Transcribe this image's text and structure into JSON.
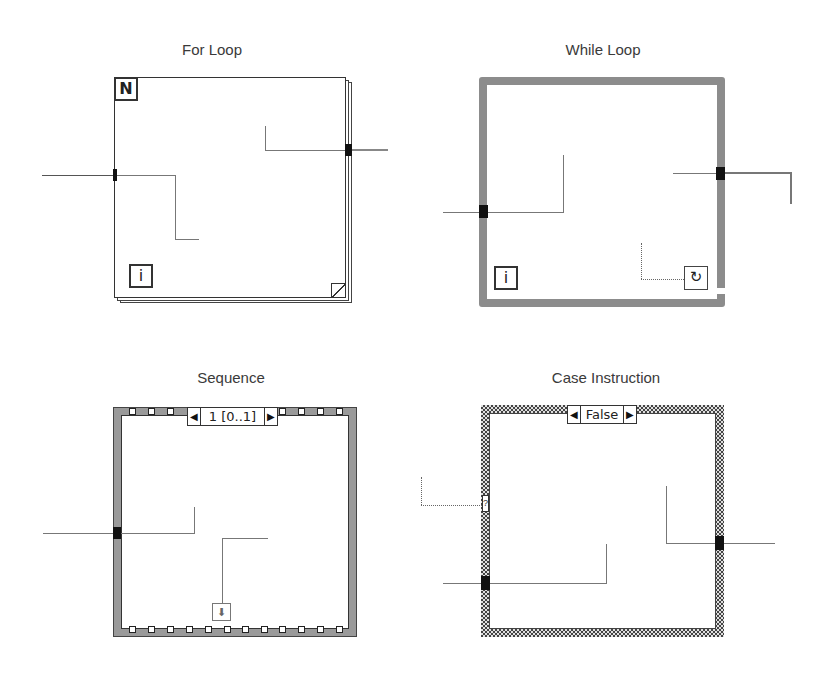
{
  "structures": {
    "for_loop": {
      "title": "For Loop",
      "count_terminal": "N",
      "iteration_terminal": "i"
    },
    "while_loop": {
      "title": "While Loop",
      "iteration_terminal": "i",
      "condition_terminal_icon": "loop-arrow-icon",
      "condition_terminal_glyph": "↻"
    },
    "sequence": {
      "title": "Sequence",
      "selector_label": "1 [0..1]",
      "prev_arrow": "◀",
      "next_arrow": "▶",
      "local_terminal_glyph": "⬇"
    },
    "case_instruction": {
      "title": "Case Instruction",
      "selector_label": "False",
      "prev_arrow": "◀",
      "next_arrow": "▶",
      "selector_terminal_glyph": "?"
    }
  },
  "colors": {
    "while_border": "#8c8c8c",
    "sequence_border": "#9a9a9a",
    "wire": "#555555",
    "tunnel": "#111111"
  }
}
